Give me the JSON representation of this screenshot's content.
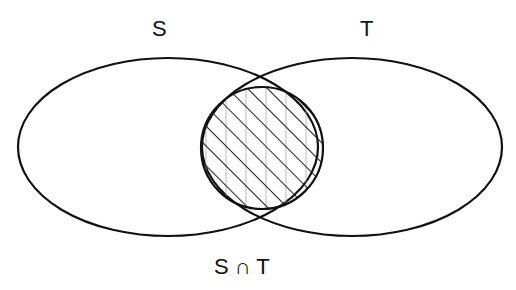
{
  "diagram": {
    "type": "venn",
    "sets": [
      {
        "label": "S"
      },
      {
        "label": "T"
      }
    ],
    "intersection_label": "S ∩ T",
    "shading": "hatched",
    "stroke_color": "#111111",
    "background": "#ffffff"
  }
}
